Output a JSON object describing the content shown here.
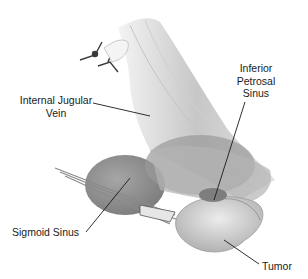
{
  "figure": {
    "type": "anatomical-illustration",
    "labels": {
      "internal_jugular_vein": {
        "line1": "Internal Jugular",
        "line2": "Vein"
      },
      "inferior_petrosal_sinus": {
        "line1": "Inferior",
        "line2": "Petrosal",
        "line3": "Sinus"
      },
      "sigmoid_sinus": "Sigmoid Sinus",
      "tumor": "Tumor"
    },
    "colors": {
      "background": "#ffffff",
      "tissue_light": "#d9d9d9",
      "tissue_mid": "#a8a8a8",
      "tissue_dark": "#6e6e6e",
      "leader_line": "#1a1a1a",
      "text": "#1a1a1a"
    }
  }
}
